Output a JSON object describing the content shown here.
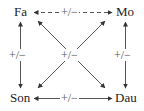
{
  "nodes": {
    "father": "Fa",
    "mother": "Mo",
    "son": "Son",
    "daughter": "Dau"
  },
  "edges": {
    "father_mother": {
      "label": "+/−",
      "style": "dashed",
      "direction": "bidirectional"
    },
    "father_son": {
      "label": "+/−",
      "style": "solid",
      "direction": "bidirectional"
    },
    "mother_daughter": {
      "label": "+/−",
      "style": "solid",
      "direction": "bidirectional"
    },
    "son_daughter": {
      "label": "+/−",
      "style": "solid",
      "direction": "bidirectional"
    },
    "diagonals": {
      "label": "+/−",
      "style": "solid",
      "pairs": [
        "Fa-Dau",
        "Mo-Son"
      ],
      "direction": "bidirectional"
    }
  },
  "colors": {
    "line": "#555555",
    "text": "#222222"
  }
}
